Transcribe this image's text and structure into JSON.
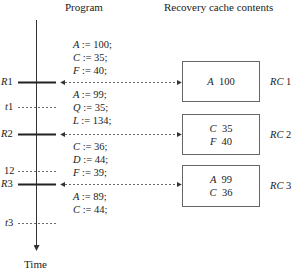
{
  "headers": {
    "program": "Program",
    "cache": "Recovery cache contents",
    "time": "Time"
  },
  "segments": [
    {
      "lines": [
        {
          "v": "A",
          "val": "100"
        },
        {
          "v": "C",
          "val": "35"
        },
        {
          "v": "F",
          "val": "40"
        }
      ]
    },
    {
      "lines": [
        {
          "v": "A",
          "val": "99"
        },
        {
          "v": "Q",
          "val": "35"
        },
        {
          "v": "L",
          "val": "134"
        }
      ]
    },
    {
      "lines": [
        {
          "v": "C",
          "val": "36"
        },
        {
          "v": "D",
          "val": "44"
        },
        {
          "v": "F",
          "val": "39"
        }
      ]
    },
    {
      "lines": [
        {
          "v": "A",
          "val": "89"
        },
        {
          "v": "C",
          "val": "44"
        }
      ]
    }
  ],
  "recovery_points": [
    {
      "label": "R",
      "num": "1"
    },
    {
      "label": "R",
      "num": "2"
    },
    {
      "label": "R",
      "num": "3"
    }
  ],
  "time_marks": [
    {
      "label": "t",
      "num": "1"
    },
    {
      "label": "",
      "num": "12"
    },
    {
      "label": "t",
      "num": "3"
    }
  ],
  "caches": [
    {
      "name": "RC",
      "num": "1",
      "entries": [
        {
          "v": "A",
          "val": "100"
        }
      ]
    },
    {
      "name": "RC",
      "num": "2",
      "entries": [
        {
          "v": "C",
          "val": "35"
        },
        {
          "v": "F",
          "val": "40"
        }
      ]
    },
    {
      "name": "RC",
      "num": "3",
      "entries": [
        {
          "v": "A",
          "val": "99"
        },
        {
          "v": "C",
          "val": "36"
        }
      ]
    }
  ],
  "assign_op": ":="
}
